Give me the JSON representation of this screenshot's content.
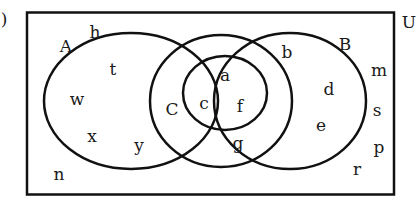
{
  "diagram": {
    "type": "venn",
    "part_marker": ")",
    "universe": {
      "label": "U"
    },
    "sets": [
      {
        "id": "A",
        "label": "A"
      },
      {
        "id": "B",
        "label": "B"
      },
      {
        "id": "C",
        "label": "C"
      },
      {
        "id": "inner",
        "label": ""
      }
    ],
    "elements": {
      "outside_all": [
        "h",
        "n",
        "m",
        "s",
        "p",
        "r"
      ],
      "A_only": [
        "t",
        "w",
        "x",
        "y"
      ],
      "B_only": [
        "b",
        "d",
        "e"
      ],
      "C_not_inner": [
        "g"
      ],
      "inner": [
        "a",
        "c",
        "f"
      ]
    },
    "labels": {
      "h": "h",
      "t": "t",
      "w": "w",
      "x": "x",
      "y": "y",
      "n": "n",
      "a": "a",
      "c": "c",
      "f": "f",
      "g": "g",
      "b": "b",
      "d": "d",
      "e": "e",
      "m": "m",
      "s": "s",
      "p": "p",
      "r": "r"
    },
    "colors": {
      "stroke": "#111111",
      "text": "#1a1a1a",
      "background": "#ffffff"
    }
  }
}
